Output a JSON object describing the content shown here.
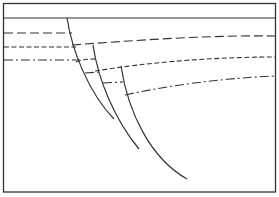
{
  "diagram": {
    "type": "geological-cross-section",
    "colors": {
      "background": "#ffffff",
      "line": "#333333"
    },
    "frame": {
      "x": 3.5,
      "y": 3.5,
      "width": 272,
      "height": 188.5
    },
    "surface_line_y": 18,
    "faults": [
      {
        "id": "fault-1",
        "path": "M67,18 C72,50 88,92 114,119"
      },
      {
        "id": "fault-2",
        "path": "M93,45 C98,80 115,120 139,149"
      },
      {
        "id": "fault-3",
        "path": "M121,66 C128,112 150,158 187,179"
      }
    ],
    "horizons": [
      {
        "id": "horizon-1-long-dash",
        "dash": "9,4",
        "segments": [
          "M4,33 L72,33",
          "M72,45 C140,40 210,35 276,36"
        ]
      },
      {
        "id": "horizon-2-short-dash",
        "dash": "5,2.5",
        "segments": [
          "M4,47 L76,47",
          "M76,62 C80,60 88,59 95,59",
          "M95,71 C150,62 215,57 276,57"
        ]
      },
      {
        "id": "horizon-3-dash-dot",
        "dash": "9,3,2,3",
        "segments": [
          "M4,60 L80,60",
          "M85,73 L100,72",
          "M103,83 L123,82",
          "M125,95 C170,85 225,78 276,76"
        ]
      }
    ]
  }
}
